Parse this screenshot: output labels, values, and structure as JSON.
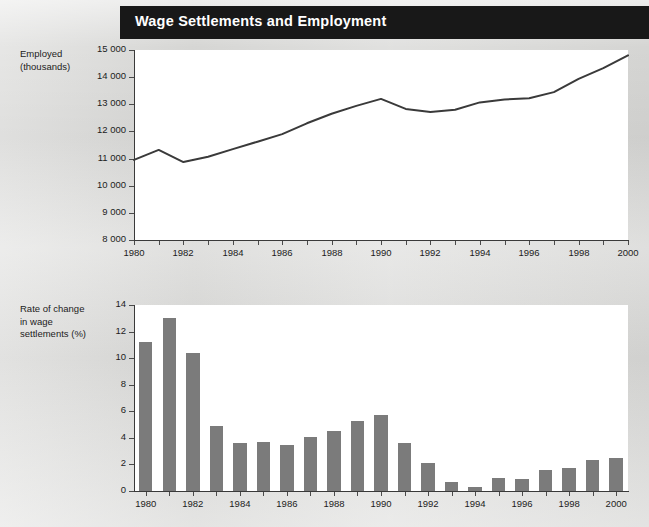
{
  "header": {
    "title": "Wage Settlements and Employment",
    "bar_color": "#181818",
    "text_color": "#ffffff"
  },
  "page": {
    "background_color": "#d9d9d7",
    "plot_background_color": "#ffffff",
    "axis_color": "#3a3a3a",
    "bar_color": "#7b7b7b",
    "line_color": "#3a3a3a"
  },
  "chart_data": [
    {
      "id": "employment",
      "type": "line",
      "title": "",
      "ylabel": "Employed\n(thousands)",
      "ylabel_lines": [
        "Employed",
        "(thousands)"
      ],
      "xlabel": "",
      "ylim": [
        8000,
        15000
      ],
      "ytick_step": 1000,
      "yticks": [
        15000,
        14000,
        13000,
        12000,
        11000,
        10000,
        9000,
        8000
      ],
      "ytick_labels": [
        "15 000",
        "14 000",
        "13 000",
        "12 000",
        "11 000",
        "10 000",
        "9 000",
        "8 000"
      ],
      "xlim": [
        1980,
        2000
      ],
      "xticks": [
        1980,
        1981,
        1982,
        1983,
        1984,
        1985,
        1986,
        1987,
        1988,
        1989,
        1990,
        1991,
        1992,
        1993,
        1994,
        1995,
        1996,
        1997,
        1998,
        1999,
        2000
      ],
      "xtick_labels_shown": [
        "1980",
        "1982",
        "1984",
        "1986",
        "1988",
        "1990",
        "1992",
        "1994",
        "1996",
        "1998",
        "2000"
      ],
      "grid": false,
      "legend": "none",
      "x": [
        1980,
        1981,
        1982,
        1983,
        1984,
        1985,
        1986,
        1987,
        1988,
        1989,
        1990,
        1991,
        1992,
        1993,
        1994,
        1995,
        1996,
        1997,
        1998,
        1999,
        2000
      ],
      "values": [
        10950,
        11320,
        10870,
        11070,
        11350,
        11620,
        11900,
        12300,
        12650,
        12940,
        13200,
        12830,
        12720,
        12800,
        13070,
        13180,
        13220,
        13450,
        13940,
        14330,
        14800
      ]
    },
    {
      "id": "wage-settlements",
      "type": "bar",
      "title": "",
      "ylabel": "Rate of change\nin wage\nsettlements (%)",
      "ylabel_lines": [
        "Rate of change",
        "in wage",
        "settlements (%)"
      ],
      "xlabel": "",
      "ylim": [
        0,
        14
      ],
      "ytick_step": 2,
      "yticks": [
        14,
        12,
        10,
        8,
        6,
        4,
        2,
        0
      ],
      "ytick_labels": [
        "14",
        "12",
        "10",
        "8",
        "6",
        "4",
        "2",
        "0"
      ],
      "categories": [
        1980,
        1981,
        1982,
        1983,
        1984,
        1985,
        1986,
        1987,
        1988,
        1989,
        1990,
        1991,
        1992,
        1993,
        1994,
        1995,
        1996,
        1997,
        1998,
        1999,
        2000
      ],
      "xtick_labels_shown": [
        "1980",
        "1982",
        "1984",
        "1986",
        "1988",
        "1990",
        "1992",
        "1994",
        "1996",
        "1998",
        "2000"
      ],
      "grid": false,
      "legend": "none",
      "values": [
        11.2,
        13.0,
        10.4,
        4.9,
        3.6,
        3.7,
        3.5,
        4.1,
        4.5,
        5.3,
        5.7,
        3.6,
        2.1,
        0.7,
        0.3,
        1.0,
        0.9,
        1.6,
        1.7,
        2.3,
        2.5
      ]
    }
  ]
}
